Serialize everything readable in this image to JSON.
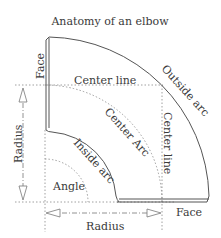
{
  "title": "Anatomy of an elbow",
  "labels": {
    "face_top": "Face",
    "face_bottom": "Face",
    "center_line_h": "Center line",
    "center_line_v": "Center line",
    "outside_arc": "Outside arc",
    "center_arc": "Center Arc",
    "inside_arc": "Inside arc",
    "angle": "Angle",
    "radius_v": "Radius",
    "radius_h": "Radius"
  },
  "colors": {
    "line": "#555555",
    "dotted": "#888888",
    "text": "#3a3a3a"
  }
}
